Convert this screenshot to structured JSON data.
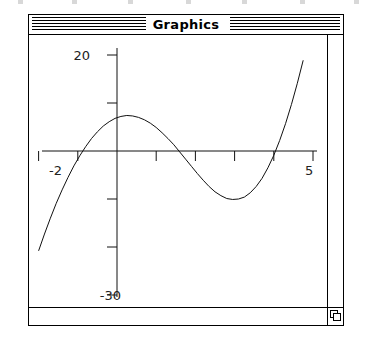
{
  "window": {
    "title": "Graphics",
    "titlebar_pattern": "horizontal-stripes",
    "grow_box_icon": "resize-grow-box-icon",
    "frame_color": "#000000",
    "background_color": "#ffffff"
  },
  "scrollbars": {
    "vertical_present": true,
    "horizontal_present": true
  },
  "chart_data": {
    "type": "line",
    "title": "",
    "xlabel": "",
    "ylabel": "",
    "xlim": [
      -2.35,
      5.35
    ],
    "ylim": [
      -31,
      22
    ],
    "grid": false,
    "legend": null,
    "axis_style": "crossing-axes-at-origin",
    "x_axis_tick_labels": [
      {
        "value": -2,
        "label": "-2"
      },
      {
        "value": 5,
        "label": "5"
      }
    ],
    "y_axis_tick_labels": [
      {
        "value": 20,
        "label": "20"
      },
      {
        "value": -30,
        "label": "-30"
      }
    ],
    "x_ticks": [
      -2,
      -1,
      0,
      1,
      2,
      3,
      4,
      5
    ],
    "y_ticks": [
      -30,
      -20,
      -10,
      0,
      10,
      20
    ],
    "series": [
      {
        "name": "cubic",
        "line_style": "solid",
        "color": "#000000",
        "x": [
          -2.3,
          -2.15,
          -2.0,
          -1.85,
          -1.7,
          -1.55,
          -1.4,
          -1.25,
          -1.1,
          -0.95,
          -0.8,
          -0.65,
          -0.5,
          -0.35,
          -0.2,
          -0.05,
          0.1,
          0.25,
          0.4,
          0.55,
          0.7,
          0.85,
          1.0,
          1.15,
          1.3,
          1.45,
          1.6,
          1.75,
          1.9,
          2.05,
          2.2,
          2.35,
          2.5,
          2.65,
          2.8,
          2.95,
          3.1,
          3.25,
          3.4,
          3.55,
          3.7,
          3.85,
          4.0,
          4.15,
          4.3,
          4.45,
          4.6,
          4.75,
          4.9,
          5.05,
          5.2
        ],
        "y": [
          -28.4,
          -24.5,
          -20.8,
          -17.3,
          -14.0,
          -10.9,
          -8.1,
          -5.5,
          -3.1,
          -1.0,
          0.9,
          2.6,
          4.0,
          5.2,
          6.1,
          6.8,
          7.2,
          7.4,
          7.3,
          7.0,
          6.5,
          5.8,
          4.9,
          3.8,
          2.6,
          1.3,
          -0.2,
          -1.7,
          -3.2,
          -4.7,
          -6.1,
          -7.4,
          -8.5,
          -9.3,
          -9.9,
          -10.1,
          -10.0,
          -9.6,
          -8.7,
          -7.4,
          -5.7,
          -3.5,
          -0.9,
          2.2,
          5.7,
          9.7,
          14.1,
          18.9,
          24.1,
          29.7,
          35.6
        ]
      }
    ]
  }
}
